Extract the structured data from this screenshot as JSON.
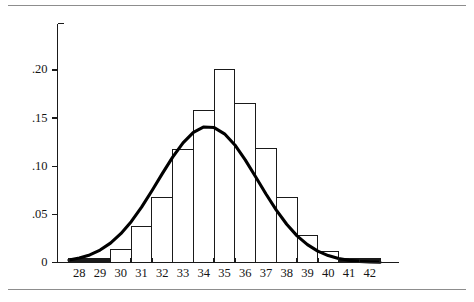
{
  "figure": {
    "background_color": "#ffffff",
    "rule_color": "#8d8d8d",
    "axis_color": "#1a1a1a",
    "curve_color": "#000000",
    "bar_fill_color": "#ffffff",
    "bar_stroke_color": "#1a1a1a"
  },
  "chart_data": {
    "type": "bar",
    "title": "",
    "subtitle": "",
    "xlabel": "",
    "ylabel": "",
    "grid": false,
    "legend": null,
    "legend_position": "none",
    "categories": [
      "28",
      "29",
      "30",
      "31",
      "32",
      "33",
      "34",
      "35",
      "36",
      "37",
      "38",
      "39",
      "40",
      "41",
      "42"
    ],
    "values": [
      0.004,
      0.004,
      0.013,
      0.037,
      0.068,
      0.117,
      0.158,
      0.201,
      0.165,
      0.118,
      0.068,
      0.028,
      0.011,
      0.004,
      0.004
    ],
    "xlim": [
      27.5,
      42.5
    ],
    "ylim": [
      0,
      0.235
    ],
    "x_tick_labels": [
      "28",
      "29",
      "30",
      "31",
      "32",
      "33",
      "34",
      "35",
      "36",
      "37",
      "38",
      "39",
      "40",
      "41",
      "42"
    ],
    "y_tick_labels": [
      "0",
      ".05",
      ".10",
      ".15",
      ".20"
    ],
    "y_tick_values": [
      0,
      0.05,
      0.1,
      0.15,
      0.2
    ],
    "bar_width": 1,
    "annotations": [],
    "overlay": {
      "name": "normal-density-curve",
      "type": "line",
      "mean": 34.8,
      "sigma": 2.14,
      "peak_value": 0.186,
      "x": [
        27.5,
        28.0,
        28.5,
        29.0,
        29.5,
        30.0,
        30.5,
        31.0,
        31.5,
        32.0,
        32.5,
        33.0,
        33.5,
        34.0,
        34.5,
        35.0,
        35.5,
        36.0,
        36.5,
        37.0,
        37.5,
        38.0,
        38.5,
        39.0,
        39.5,
        40.0,
        40.5,
        41.0,
        41.5,
        42.0,
        42.5
      ],
      "y": [
        0.0025,
        0.0046,
        0.0079,
        0.0129,
        0.0201,
        0.0299,
        0.0424,
        0.0575,
        0.0745,
        0.0923,
        0.1094,
        0.1243,
        0.1352,
        0.1408,
        0.1402,
        0.1337,
        0.1221,
        0.1066,
        0.0891,
        0.0712,
        0.0544,
        0.0397,
        0.0277,
        0.0185,
        0.0118,
        0.0072,
        0.0042,
        0.0023,
        0.0012,
        0.0006,
        0.0003
      ]
    }
  }
}
